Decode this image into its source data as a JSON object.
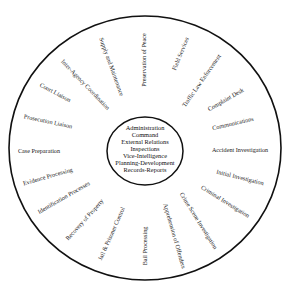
{
  "diagram": {
    "center": {
      "functions": [
        "Administration",
        "Command",
        "External Relations",
        "Inspections",
        "Vice-Intelligence",
        "Planning-Development",
        "Records-Reports"
      ]
    },
    "ring_labels": [
      {
        "text": "Preservation of Peace",
        "x": 145,
        "y": 60,
        "rotate": -90
      },
      {
        "text": "Field Services",
        "x": 181,
        "y": 54,
        "rotate": -68
      },
      {
        "text": "Traffic Law Enforcement",
        "x": 202,
        "y": 81,
        "rotate": -55
      },
      {
        "text": "Complaint Desk",
        "x": 226,
        "y": 100,
        "rotate": -30
      },
      {
        "text": "Communications",
        "x": 233,
        "y": 124,
        "rotate": -13
      },
      {
        "text": "Accident Investigation",
        "x": 240,
        "y": 151,
        "rotate": 0
      },
      {
        "text": "Initial Investigation",
        "x": 240,
        "y": 178,
        "rotate": 14
      },
      {
        "text": "Criminal Investigation",
        "x": 225,
        "y": 202,
        "rotate": 32
      },
      {
        "text": "Crime Scene Investigation",
        "x": 198,
        "y": 221,
        "rotate": 58
      },
      {
        "text": "Apprehension of Offenders",
        "x": 174,
        "y": 236,
        "rotate": 74
      },
      {
        "text": "Bail Processing",
        "x": 146,
        "y": 246,
        "rotate": -90
      },
      {
        "text": "Jail & Prisoner Control",
        "x": 112,
        "y": 234,
        "rotate": -66
      },
      {
        "text": "Recovery of Property",
        "x": 85,
        "y": 220,
        "rotate": -48
      },
      {
        "text": "Identification Processes",
        "x": 64,
        "y": 198,
        "rotate": -30
      },
      {
        "text": "Evidence Processing",
        "x": 48,
        "y": 177,
        "rotate": -16
      },
      {
        "text": "Case Preparation",
        "x": 39,
        "y": 152,
        "rotate": 0
      },
      {
        "text": "Prosecution Liaison",
        "x": 48,
        "y": 122,
        "rotate": 12
      },
      {
        "text": "Court Liaison",
        "x": 55,
        "y": 93,
        "rotate": 28
      },
      {
        "text": "Inter-Agency Coordination",
        "x": 85,
        "y": 85,
        "rotate": 46
      },
      {
        "text": "Supply and Maintenance",
        "x": 111,
        "y": 67,
        "rotate": 70
      }
    ],
    "colors": {
      "stroke": "#111111",
      "text": "#1a1a1a",
      "background": "#ffffff"
    }
  }
}
